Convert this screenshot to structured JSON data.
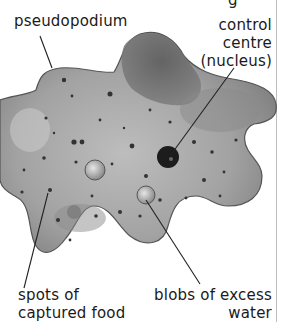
{
  "diagram": {
    "labels": {
      "pseudopodium": "pseudopodium",
      "control_centre": [
        "control",
        "centre",
        "(nucleus)"
      ],
      "spots": [
        "spots of",
        "captured food"
      ],
      "blobs": [
        "blobs of excess",
        "water"
      ]
    },
    "colors": {
      "body_light": "#b8b8b8",
      "body_dark": "#6a6a6a",
      "nucleus": "#1c1c1c",
      "leader_line": "#222222",
      "text": "#1a1a1a"
    }
  }
}
